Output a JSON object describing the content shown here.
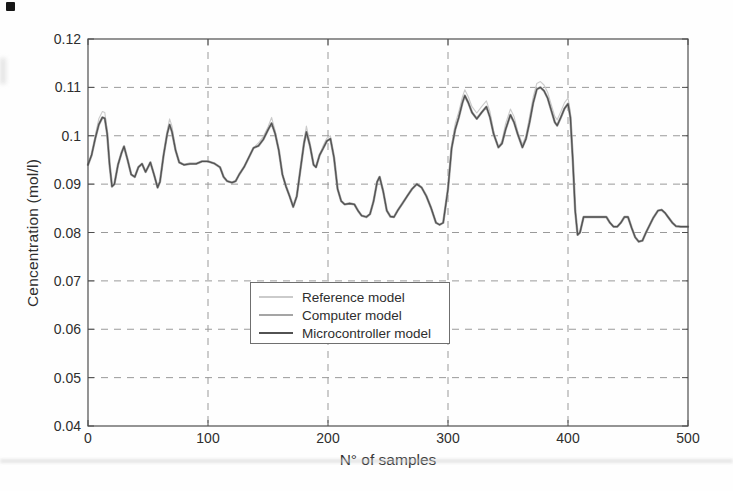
{
  "chart_data": {
    "type": "line",
    "title": "",
    "xlabel": "N° of samples",
    "ylabel": "Cencentration (mol/l)",
    "xlim": [
      0,
      500
    ],
    "ylim": [
      0.04,
      0.12
    ],
    "xticks": [
      0,
      100,
      200,
      300,
      400,
      500
    ],
    "xtick_labels": [
      "0",
      "100",
      "200",
      "300",
      "400",
      "500"
    ],
    "yticks": [
      0.12,
      0.11,
      0.1,
      0.09,
      0.08,
      0.07,
      0.06,
      0.05,
      0.04
    ],
    "ytick_labels": [
      "0.12",
      "0.11",
      "0.1",
      "0.09",
      "0.08",
      "0.07",
      "0.06",
      "0.05",
      "0.04"
    ],
    "grid": "dashed",
    "grid_color": "#9a9a9a",
    "axis_color": "#4d4d4d",
    "text_color": "#2e2e2e",
    "legend_position": "inside lower-center-left",
    "x": [
      0,
      3,
      6,
      9,
      12,
      14,
      16,
      18,
      20,
      22,
      25,
      28,
      30,
      33,
      36,
      39,
      42,
      45,
      48,
      50,
      52,
      55,
      58,
      60,
      63,
      66,
      68,
      70,
      73,
      76,
      80,
      85,
      90,
      95,
      100,
      105,
      110,
      113,
      116,
      120,
      123,
      126,
      130,
      134,
      138,
      142,
      146,
      150,
      153,
      156,
      159,
      162,
      165,
      168,
      171,
      174,
      177,
      180,
      182,
      185,
      188,
      190,
      193,
      196,
      199,
      202,
      205,
      208,
      211,
      214,
      218,
      222,
      225,
      228,
      232,
      235,
      238,
      241,
      243,
      246,
      249,
      252,
      255,
      258,
      262,
      266,
      270,
      274,
      278,
      282,
      286,
      290,
      293,
      296,
      300,
      303,
      306,
      309,
      312,
      314,
      317,
      320,
      324,
      328,
      332,
      335,
      338,
      342,
      345,
      348,
      352,
      355,
      358,
      362,
      365,
      368,
      371,
      374,
      377,
      380,
      383,
      386,
      389,
      391,
      394,
      397,
      400,
      402,
      404,
      406,
      408,
      410,
      413,
      416,
      420,
      424,
      428,
      432,
      435,
      438,
      441,
      444,
      447,
      450,
      453,
      456,
      459,
      462,
      465,
      468,
      471,
      475,
      478,
      481,
      484,
      487,
      490,
      494,
      497,
      500
    ],
    "series": [
      {
        "name": "Reference model",
        "color": "#cbcbcb",
        "values": [
          0.094,
          0.096,
          0.1,
          0.1035,
          0.105,
          0.1048,
          0.101,
          0.094,
          0.0895,
          0.09,
          0.094,
          0.0965,
          0.0978,
          0.095,
          0.092,
          0.0915,
          0.0935,
          0.0942,
          0.0925,
          0.0935,
          0.0945,
          0.092,
          0.0893,
          0.0905,
          0.096,
          0.101,
          0.1035,
          0.102,
          0.097,
          0.0945,
          0.094,
          0.0942,
          0.0942,
          0.0947,
          0.0947,
          0.0943,
          0.0935,
          0.0915,
          0.0906,
          0.0903,
          0.0906,
          0.092,
          0.0935,
          0.0955,
          0.0975,
          0.0985,
          0.0998,
          0.1018,
          0.1038,
          0.101,
          0.097,
          0.092,
          0.0895,
          0.0875,
          0.0853,
          0.0875,
          0.093,
          0.099,
          0.102,
          0.0985,
          0.094,
          0.0935,
          0.096,
          0.098,
          0.0995,
          0.1,
          0.0955,
          0.089,
          0.0865,
          0.0858,
          0.086,
          0.0858,
          0.0845,
          0.0835,
          0.0832,
          0.0838,
          0.0865,
          0.0905,
          0.0915,
          0.0885,
          0.0845,
          0.0833,
          0.0832,
          0.0845,
          0.086,
          0.0875,
          0.089,
          0.09,
          0.0893,
          0.0875,
          0.085,
          0.082,
          0.0816,
          0.082,
          0.089,
          0.098,
          0.1025,
          0.105,
          0.108,
          0.1095,
          0.108,
          0.106,
          0.1047,
          0.106,
          0.1072,
          0.105,
          0.101,
          0.0976,
          0.099,
          0.1025,
          0.1055,
          0.104,
          0.101,
          0.0982,
          0.1,
          0.104,
          0.108,
          0.1108,
          0.1112,
          0.1105,
          0.109,
          0.1065,
          0.104,
          0.1033,
          0.105,
          0.1068,
          0.1078,
          0.105,
          0.095,
          0.0845,
          0.0795,
          0.08,
          0.0832,
          0.0832,
          0.0832,
          0.0832,
          0.0832,
          0.0832,
          0.082,
          0.0812,
          0.0812,
          0.082,
          0.0832,
          0.0832,
          0.081,
          0.079,
          0.0781,
          0.0783,
          0.08,
          0.0815,
          0.083,
          0.0845,
          0.0847,
          0.084,
          0.083,
          0.082,
          0.0813,
          0.0812,
          0.0812,
          0.0812
        ]
      },
      {
        "name": "Computer model",
        "color": "#a5a5a5",
        "values": [
          0.094,
          0.096,
          0.0994,
          0.1023,
          0.1038,
          0.1036,
          0.1004,
          0.094,
          0.0895,
          0.09,
          0.094,
          0.0965,
          0.0978,
          0.095,
          0.092,
          0.0915,
          0.0935,
          0.0942,
          0.0925,
          0.0935,
          0.0945,
          0.092,
          0.0893,
          0.0905,
          0.096,
          0.1004,
          0.1023,
          0.1008,
          0.097,
          0.0945,
          0.094,
          0.0942,
          0.0942,
          0.0947,
          0.0947,
          0.0943,
          0.0935,
          0.0915,
          0.0906,
          0.0903,
          0.0906,
          0.092,
          0.0935,
          0.0955,
          0.0975,
          0.0979,
          0.0992,
          0.1012,
          0.1026,
          0.1004,
          0.097,
          0.092,
          0.0895,
          0.0875,
          0.0853,
          0.0875,
          0.093,
          0.0984,
          0.1008,
          0.0979,
          0.094,
          0.0935,
          0.096,
          0.0974,
          0.0989,
          0.0994,
          0.0955,
          0.089,
          0.0865,
          0.0858,
          0.086,
          0.0858,
          0.0845,
          0.0835,
          0.0832,
          0.0838,
          0.0865,
          0.0905,
          0.0915,
          0.0885,
          0.0845,
          0.0833,
          0.0832,
          0.0845,
          0.086,
          0.0875,
          0.089,
          0.09,
          0.0893,
          0.0875,
          0.085,
          0.082,
          0.0816,
          0.082,
          0.089,
          0.0974,
          0.1013,
          0.1038,
          0.1068,
          0.1083,
          0.1068,
          0.1048,
          0.1035,
          0.1048,
          0.106,
          0.1038,
          0.1004,
          0.0976,
          0.0984,
          0.1013,
          0.1043,
          0.1028,
          0.1004,
          0.0976,
          0.0994,
          0.1028,
          0.1068,
          0.1096,
          0.11,
          0.1093,
          0.1078,
          0.1053,
          0.1028,
          0.1021,
          0.1038,
          0.1056,
          0.1066,
          0.1038,
          0.095,
          0.0845,
          0.0795,
          0.08,
          0.0832,
          0.0832,
          0.0832,
          0.0832,
          0.0832,
          0.0832,
          0.082,
          0.0812,
          0.0812,
          0.082,
          0.0832,
          0.0832,
          0.081,
          0.079,
          0.0781,
          0.0783,
          0.08,
          0.0815,
          0.083,
          0.0845,
          0.0847,
          0.084,
          0.083,
          0.082,
          0.0813,
          0.0812,
          0.0812,
          0.0812
        ]
      },
      {
        "name": "Microcontroller model",
        "color": "#525252",
        "values": [
          0.094,
          0.096,
          0.0994,
          0.1023,
          0.1038,
          0.1036,
          0.1004,
          0.094,
          0.0895,
          0.09,
          0.094,
          0.0965,
          0.0978,
          0.095,
          0.092,
          0.0915,
          0.0935,
          0.0942,
          0.0925,
          0.0935,
          0.0945,
          0.092,
          0.0893,
          0.0905,
          0.096,
          0.1004,
          0.1023,
          0.1008,
          0.097,
          0.0945,
          0.094,
          0.0942,
          0.0942,
          0.0947,
          0.0947,
          0.0943,
          0.0935,
          0.0915,
          0.0906,
          0.0903,
          0.0906,
          0.092,
          0.0935,
          0.0955,
          0.0975,
          0.0979,
          0.0992,
          0.1012,
          0.1026,
          0.1004,
          0.097,
          0.092,
          0.0895,
          0.0875,
          0.0853,
          0.0875,
          0.093,
          0.0984,
          0.1008,
          0.0979,
          0.094,
          0.0935,
          0.096,
          0.0974,
          0.0989,
          0.0994,
          0.0955,
          0.089,
          0.0865,
          0.0858,
          0.086,
          0.0858,
          0.0845,
          0.0835,
          0.0832,
          0.0838,
          0.0865,
          0.0905,
          0.0915,
          0.0885,
          0.0845,
          0.0833,
          0.0832,
          0.0845,
          0.086,
          0.0875,
          0.089,
          0.09,
          0.0893,
          0.0875,
          0.085,
          0.082,
          0.0816,
          0.082,
          0.089,
          0.0974,
          0.1013,
          0.1038,
          0.1068,
          0.1083,
          0.1068,
          0.1048,
          0.1035,
          0.1048,
          0.106,
          0.1038,
          0.1004,
          0.0976,
          0.0984,
          0.1013,
          0.1043,
          0.1028,
          0.1004,
          0.0976,
          0.0994,
          0.1028,
          0.1068,
          0.1096,
          0.11,
          0.1093,
          0.1078,
          0.1053,
          0.1028,
          0.1021,
          0.1038,
          0.1056,
          0.1066,
          0.1038,
          0.095,
          0.0845,
          0.0795,
          0.08,
          0.0832,
          0.0832,
          0.0832,
          0.0832,
          0.0832,
          0.0832,
          0.082,
          0.0812,
          0.0812,
          0.082,
          0.0832,
          0.0832,
          0.081,
          0.079,
          0.0781,
          0.0783,
          0.08,
          0.0815,
          0.083,
          0.0845,
          0.0847,
          0.084,
          0.083,
          0.082,
          0.0813,
          0.0812,
          0.0812,
          0.0812
        ]
      }
    ]
  }
}
